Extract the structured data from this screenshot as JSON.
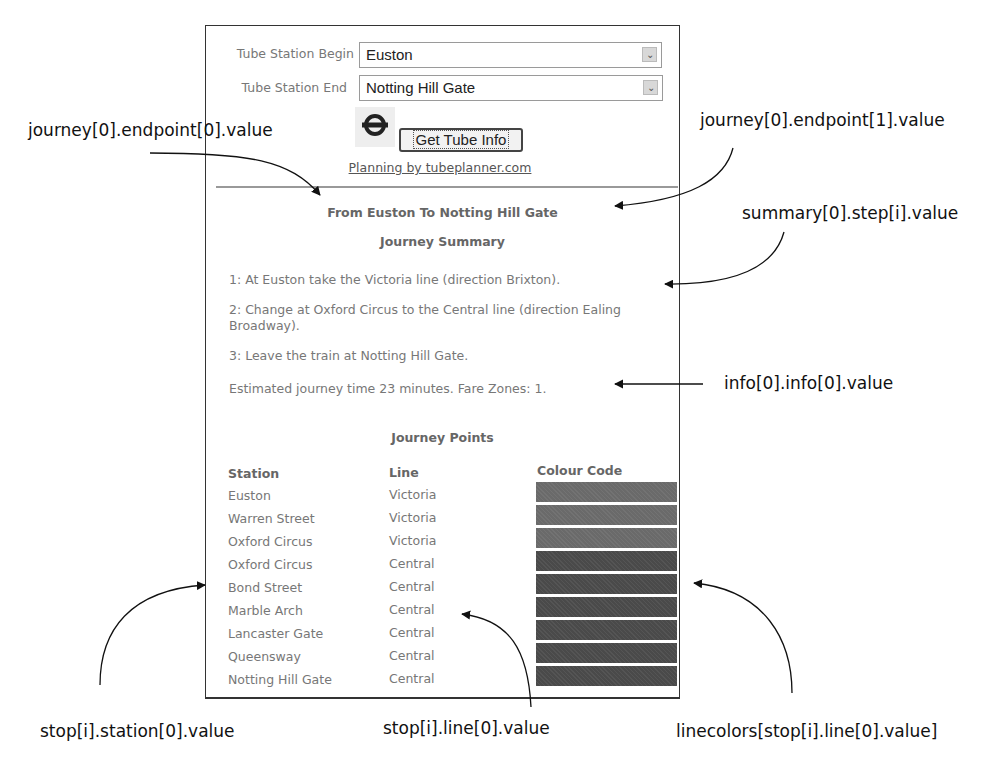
{
  "form": {
    "begin_label": "Tube Station Begin",
    "begin_value": "Euston",
    "end_label": "Tube Station End",
    "end_value": "Notting Hill Gate",
    "logo_icon": "london-underground-roundel-icon",
    "submit_label": "Get Tube Info",
    "credit_link": "Planning by tubeplanner.com"
  },
  "result": {
    "title": "From Euston To Notting Hill Gate",
    "summary_heading": "Journey Summary",
    "steps": [
      "1: At Euston take the Victoria line (direction Brixton).",
      "2: Change at Oxford Circus to the Central line (direction Ealing Broadway).",
      "3: Leave the train at Notting Hill Gate."
    ],
    "info": "Estimated journey time 23 minutes. Fare Zones: 1.",
    "points_heading": "Journey Points",
    "columns": [
      "Station",
      "Line",
      "Colour Code"
    ],
    "stops": [
      {
        "station": "Euston",
        "line": "Victoria",
        "color": "#6a6a6a"
      },
      {
        "station": "Warren Street",
        "line": "Victoria",
        "color": "#6a6a6a"
      },
      {
        "station": "Oxford Circus",
        "line": "Victoria",
        "color": "#6a6a6a"
      },
      {
        "station": "Oxford Circus",
        "line": "Central",
        "color": "#4a4a4a"
      },
      {
        "station": "Bond Street",
        "line": "Central",
        "color": "#4a4a4a"
      },
      {
        "station": "Marble Arch",
        "line": "Central",
        "color": "#4a4a4a"
      },
      {
        "station": "Lancaster Gate",
        "line": "Central",
        "color": "#4a4a4a"
      },
      {
        "station": "Queensway",
        "line": "Central",
        "color": "#4a4a4a"
      },
      {
        "station": "Notting Hill Gate",
        "line": "Central",
        "color": "#4a4a4a"
      }
    ]
  },
  "annotations": {
    "endpoint0": "journey[0].endpoint[0].value",
    "endpoint1": "journey[0].endpoint[1].value",
    "summary_step": "summary[0].step[i].value",
    "info": "info[0].info[0].value",
    "station": "stop[i].station[0].value",
    "line": "stop[i].line[0].value",
    "linecolors": "linecolors[stop[i].line[0].value]"
  }
}
